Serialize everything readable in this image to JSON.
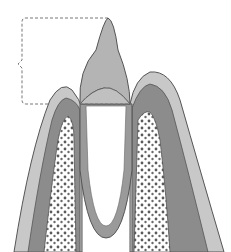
{
  "diagram": {
    "labels": [],
    "colors": {
      "background": "#ffffff",
      "enamel_crown": "#b4b4b4",
      "gingiva_light": "#c8c8c8",
      "gingiva_dark": "#8c8c8c",
      "root": "#9a9a9a",
      "bone_fill": "#ffffff",
      "bone_dots": "#5a5a5a",
      "outline": "#555555",
      "bracket": "#777777"
    }
  }
}
